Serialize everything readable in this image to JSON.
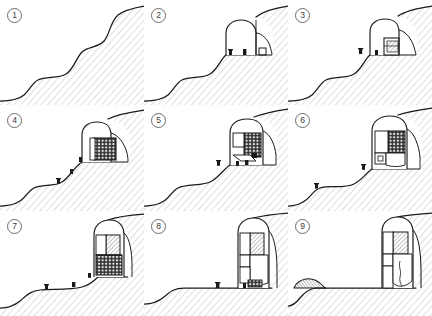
{
  "figure": {
    "panel_count": 9,
    "panel_width": 144,
    "panel_height": 105,
    "background_color": "#ffffff",
    "line_color": "#1a1a1a",
    "hatch_color": "#9a9a9a",
    "fill_dark": "#262626",
    "fill_mid": "#777777",
    "fill_light": "#ffffff"
  },
  "panels": [
    {
      "number": "1",
      "caption": "Original stepped hillside profile",
      "stage": "existing-terrain",
      "terrain_path": "M 0 101 C 10 101 18 100 24 95 C 30 90 32 83 38 80 C 46 76 58 79 66 74 C 74 69 76 58 82 52 C 88 46 98 48 104 41 C 110 34 110 22 118 15 C 124 10 133 8 144 6",
      "has_excavation": false,
      "has_structure": false,
      "has_scaffold": false,
      "figure_count": 0
    },
    {
      "number": "2",
      "caption": "Arched cavity excavated into upper cliff face",
      "stage": "excavation",
      "terrain_path": "M 0 101 C 10 101 18 100 24 95 C 30 90 32 83 38 80 C 46 76 58 79 66 74 C 74 69 76 58 82 52 C 88 46 95 48 100 45 C 104 42 105 38 108 35 C 112 31 120 27 126 22 C 132 17 136 10 144 6",
      "cavity": {
        "floor_y": 52,
        "left_x": 82,
        "right_x": 128,
        "crown_y": 20
      },
      "has_excavation": true,
      "has_structure": false,
      "has_scaffold": false,
      "figure_count": 3
    },
    {
      "number": "3",
      "caption": "First structural bay erected inside cavity",
      "stage": "first-bay",
      "has_excavation": true,
      "has_structure": true,
      "has_scaffold": false,
      "figure_count": 2
    },
    {
      "number": "4",
      "caption": "Scaffold grid and formwork raised against rock face",
      "stage": "scaffolding",
      "has_excavation": true,
      "has_structure": true,
      "has_scaffold": true,
      "figure_count": 3
    },
    {
      "number": "5",
      "caption": "Cavity enlarged, upper floors cast",
      "stage": "upper-floors",
      "has_excavation": true,
      "has_structure": true,
      "has_scaffold": true,
      "figure_count": 3
    },
    {
      "number": "6",
      "caption": "Rooms subdivided, facade frame defined",
      "stage": "subdivision",
      "has_excavation": true,
      "has_structure": true,
      "has_scaffold": true,
      "figure_count": 2
    },
    {
      "number": "7",
      "caption": "Lower slope cut back, full height reached",
      "stage": "slope-cut",
      "has_excavation": true,
      "has_structure": true,
      "has_scaffold": true,
      "figure_count": 3
    },
    {
      "number": "8",
      "caption": "Ground levelled to a flat terrace",
      "stage": "levelled-terrace",
      "has_excavation": true,
      "has_structure": true,
      "has_scaffold": true,
      "figure_count": 3
    },
    {
      "number": "9",
      "caption": "Building complete; spoil mound remains at far left",
      "stage": "completed",
      "has_excavation": true,
      "has_structure": true,
      "has_scaffold": false,
      "figure_count": 0,
      "has_spoil_mound": true
    }
  ]
}
